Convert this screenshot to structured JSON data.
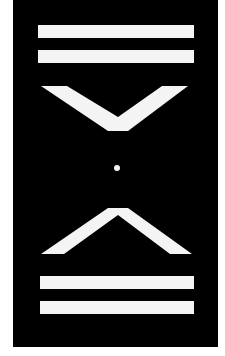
{
  "graphic": {
    "background_color": "#ffffff",
    "panel_color": "#000000",
    "shape_color": "#f4f4f4",
    "elements": [
      {
        "name": "top-bar-1",
        "type": "bar"
      },
      {
        "name": "top-bar-2",
        "type": "bar"
      },
      {
        "name": "top-chevron",
        "type": "chevron-down"
      },
      {
        "name": "center-dot",
        "type": "dot"
      },
      {
        "name": "bottom-chevron",
        "type": "chevron-up"
      },
      {
        "name": "bottom-bar-1",
        "type": "bar"
      },
      {
        "name": "bottom-bar-2",
        "type": "bar"
      }
    ]
  }
}
